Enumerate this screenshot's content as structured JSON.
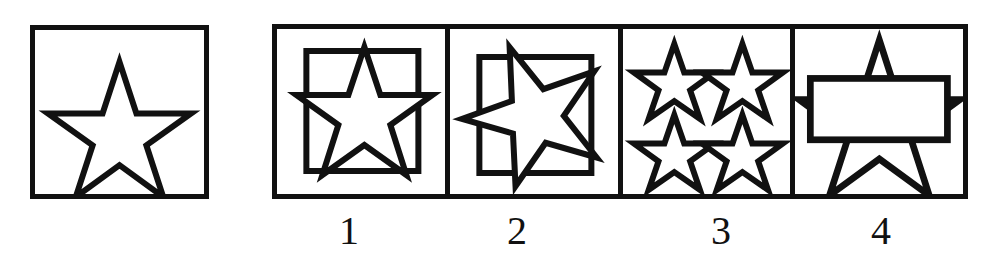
{
  "puzzle": {
    "type": "non-verbal-reasoning-multiple-choice",
    "title": "Star shape matching item",
    "stroke_color": "#111111",
    "background_color": "#ffffff",
    "prompt": {
      "name": "prompt-cell",
      "description": "Single five-pointed star outline, point up, centered in a square frame",
      "shapes": [
        {
          "kind": "star",
          "points": 5,
          "orientation": "point-up",
          "fill": "none",
          "outline": true
        }
      ]
    },
    "options": [
      {
        "label": "1",
        "name": "option-1",
        "description": "Five-pointed star, point up, inside a smaller inner square; star slightly overlaps the inner square edges",
        "shapes": [
          {
            "kind": "square",
            "role": "inner-frame"
          },
          {
            "kind": "star",
            "points": 5,
            "orientation": "point-up"
          }
        ]
      },
      {
        "label": "2",
        "name": "option-2",
        "description": "Five-pointed star rotated roughly 180 degrees (point down), inside a smaller inner square",
        "shapes": [
          {
            "kind": "square",
            "role": "inner-frame"
          },
          {
            "kind": "star",
            "points": 5,
            "orientation": "point-down-rotated"
          }
        ]
      },
      {
        "label": "3",
        "name": "option-3",
        "description": "Four small five-pointed stars arranged in a two-by-two grid",
        "shapes": [
          {
            "kind": "star",
            "points": 5,
            "orientation": "point-up",
            "count": 4,
            "arrangement": "2x2-grid"
          }
        ]
      },
      {
        "label": "4",
        "name": "option-4",
        "description": "Large five-pointed star with a white horizontal rectangle overlapping its middle",
        "shapes": [
          {
            "kind": "star",
            "points": 5,
            "orientation": "point-up",
            "size": "large"
          },
          {
            "kind": "rectangle",
            "role": "overlay-band",
            "fill": "white"
          }
        ]
      }
    ]
  }
}
